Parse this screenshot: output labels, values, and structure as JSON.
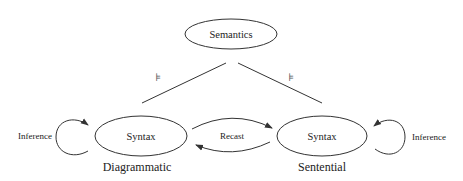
{
  "diagram": {
    "nodes": {
      "semantics": {
        "label": "Semantics"
      },
      "syntax_left": {
        "label": "Syntax",
        "caption": "Diagrammatic"
      },
      "syntax_right": {
        "label": "Syntax",
        "caption": "Sentential"
      }
    },
    "edges": {
      "semantics_left": {
        "symbol": "⊧"
      },
      "semantics_right": {
        "symbol": "⊧"
      },
      "recast": {
        "label": "Recast"
      },
      "inference_left": {
        "label": "Inference"
      },
      "inference_right": {
        "label": "Inference"
      }
    },
    "colors": {
      "line": "#333333",
      "text": "#222222",
      "background": "#ffffff"
    }
  }
}
